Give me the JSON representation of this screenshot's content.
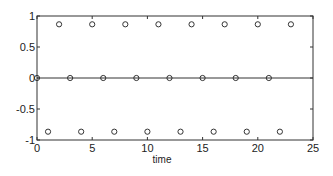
{
  "chart_data": {
    "type": "scatter",
    "title": "",
    "xlabel": "time",
    "ylabel": "",
    "xlim": [
      0,
      25
    ],
    "ylim": [
      -1,
      1
    ],
    "xticks": [
      0,
      5,
      10,
      15,
      20,
      25
    ],
    "xtick_labels": [
      "0",
      "5",
      "10",
      "15",
      "20",
      "25"
    ],
    "yticks": [
      1,
      0.5,
      0,
      -0.5,
      -1
    ],
    "ytick_labels": [
      "1",
      "0.5",
      "0",
      "-0.5",
      "-1"
    ],
    "zero_line": true,
    "grid": false,
    "marker": "circle-open",
    "series": [
      {
        "name": "samples",
        "x": [
          0,
          1,
          2,
          3,
          4,
          5,
          6,
          7,
          8,
          9,
          10,
          11,
          12,
          13,
          14,
          15,
          16,
          17,
          18,
          19,
          20,
          21,
          22,
          23
        ],
        "y": [
          0,
          -0.866,
          0.866,
          0,
          -0.866,
          0.866,
          0,
          -0.866,
          0.866,
          0,
          -0.866,
          0.866,
          0,
          -0.866,
          0.866,
          0,
          -0.866,
          0.866,
          0,
          -0.866,
          0.866,
          0,
          -0.866,
          0.866
        ]
      }
    ]
  }
}
